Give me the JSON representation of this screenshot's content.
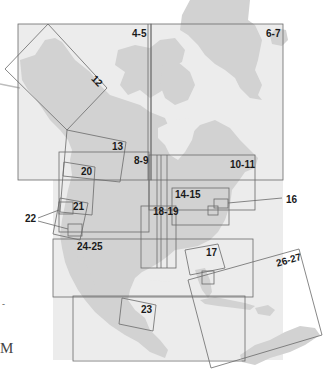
{
  "map": {
    "colors": {
      "land": "#d2d2d2",
      "water": "#ececec",
      "background": "#ffffff",
      "frame": "#6a6a6a",
      "label": "#1a1a1a"
    },
    "index_labels": [
      {
        "id": "4-5",
        "text": "4-5"
      },
      {
        "id": "6-7",
        "text": "6-7"
      },
      {
        "id": "12",
        "text": "12"
      },
      {
        "id": "13",
        "text": "13"
      },
      {
        "id": "8-9",
        "text": "8-9"
      },
      {
        "id": "10-11",
        "text": "10-11"
      },
      {
        "id": "20",
        "text": "20"
      },
      {
        "id": "14-15",
        "text": "14-15"
      },
      {
        "id": "16",
        "text": "16"
      },
      {
        "id": "21",
        "text": "21"
      },
      {
        "id": "22",
        "text": "22"
      },
      {
        "id": "18-19",
        "text": "18-19"
      },
      {
        "id": "24-25",
        "text": "24-25"
      },
      {
        "id": "17",
        "text": "17"
      },
      {
        "id": "26-27",
        "text": "26-27"
      },
      {
        "id": "23",
        "text": "23"
      }
    ]
  },
  "margin": {
    "dash": "-",
    "letter": "M"
  }
}
